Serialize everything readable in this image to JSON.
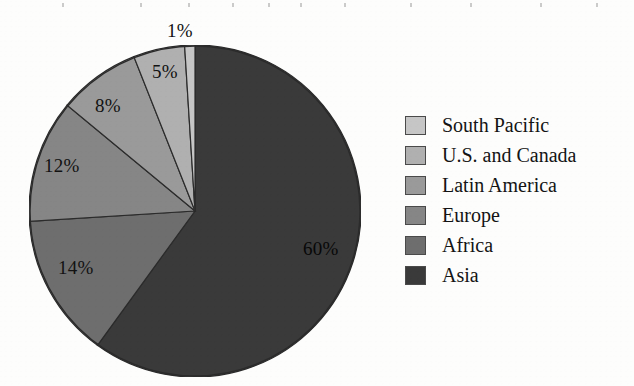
{
  "chart_data": {
    "type": "pie",
    "title": "",
    "subtitle": "",
    "xlabel": "",
    "ylabel": "",
    "legend_position": "right",
    "grid": false,
    "total": 100,
    "unit": "%",
    "categories": [
      "Asia",
      "Africa",
      "Europe",
      "Latin America",
      "U.S. and Canada",
      "South Pacific"
    ],
    "values": [
      60,
      14,
      12,
      8,
      5,
      1
    ],
    "slices": [
      {
        "label": "Asia",
        "value": 60,
        "display": "60%",
        "color": "#3a3a3a",
        "start_deg": 0,
        "end_deg": 216
      },
      {
        "label": "Africa",
        "value": 14,
        "display": "14%",
        "color": "#6e6e6e",
        "start_deg": 216,
        "end_deg": 266.4
      },
      {
        "label": "Europe",
        "value": 12,
        "display": "12%",
        "color": "#868686",
        "start_deg": 266.4,
        "end_deg": 309.6
      },
      {
        "label": "Latin America",
        "value": 8,
        "display": "8%",
        "color": "#9a9a9a",
        "start_deg": 309.6,
        "end_deg": 338.4
      },
      {
        "label": "U.S. and Canada",
        "value": 5,
        "display": "5%",
        "color": "#b0b0b0",
        "start_deg": 338.4,
        "end_deg": 356.4
      },
      {
        "label": "South Pacific",
        "value": 1,
        "display": "1%",
        "color": "#c6c6c6",
        "start_deg": 356.4,
        "end_deg": 360
      }
    ],
    "geometry": {
      "center_x": 166,
      "center_y": 166,
      "radius": 166,
      "start_angle_deg": 0,
      "direction": "clockwise"
    }
  },
  "labels": {
    "asia": "60%",
    "africa": "14%",
    "europe": "12%",
    "latin_america": "8%",
    "us_canada": "5%",
    "south_pacific": "1%"
  },
  "legend": {
    "items": [
      {
        "label": "South Pacific",
        "color": "#c6c6c6"
      },
      {
        "label": "U.S. and Canada",
        "color": "#b0b0b0"
      },
      {
        "label": "Latin America",
        "color": "#9a9a9a"
      },
      {
        "label": "Europe",
        "color": "#868686"
      },
      {
        "label": "Africa",
        "color": "#6e6e6e"
      },
      {
        "label": "Asia",
        "color": "#3a3a3a"
      }
    ]
  },
  "colors": {
    "background": "#fdfdfc",
    "outline": "#2b2b2b",
    "text": "#141414"
  }
}
